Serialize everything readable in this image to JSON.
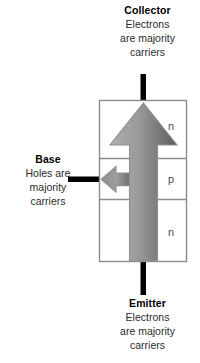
{
  "diagram": {
    "kind": "npn-bipolar-junction-transistor",
    "terminals": {
      "collector": {
        "title": "Collector",
        "lines": [
          "Electrons",
          "are majority",
          "carriers"
        ]
      },
      "base": {
        "title": "Base",
        "lines": [
          "Holes are",
          "majority",
          "carriers"
        ]
      },
      "emitter": {
        "title": "Emitter",
        "lines": [
          "Electrons",
          "are majority",
          "carriers"
        ]
      }
    },
    "regions": [
      {
        "id": "region-top",
        "label": "n"
      },
      {
        "id": "region-middle",
        "label": "p"
      },
      {
        "id": "region-bottom",
        "label": "n"
      }
    ],
    "colors": {
      "background": "#ffffff",
      "body_outline": "#8c8c8c",
      "body_fill": "#ffffff",
      "lead_black": "#000000",
      "arrow_light": "#b9b9b9",
      "arrow_dark": "#5e5e5e",
      "arrow_stroke": "#8f8f8f",
      "text": "#231f20",
      "region_label": "#4d4d4d"
    }
  }
}
